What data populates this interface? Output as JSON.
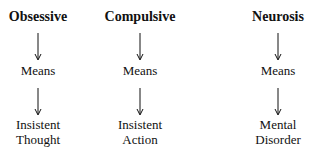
{
  "diagram": {
    "columns": [
      {
        "heading": "Obsessive",
        "middle": "Means",
        "bottom_line1": "Insistent",
        "bottom_line2": "Thought"
      },
      {
        "heading": "Compulsive",
        "middle": "Means",
        "bottom_line1": "Insistent",
        "bottom_line2": "Action"
      },
      {
        "heading": "Neurosis",
        "middle": "Means",
        "bottom_line1": "Mental",
        "bottom_line2": "Disorder"
      }
    ],
    "arrow_color": "#111111",
    "text_color": "#111111",
    "background": "#ffffff"
  }
}
